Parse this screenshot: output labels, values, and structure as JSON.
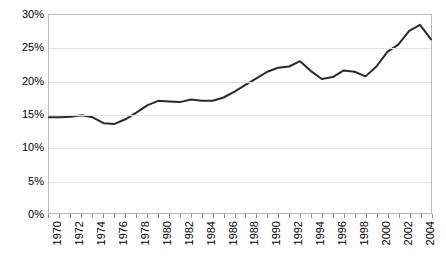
{
  "chart_data": {
    "type": "line",
    "title": "",
    "subtitle": "",
    "xlabel": "",
    "ylabel": "",
    "grid": true,
    "legend": false,
    "legend_position": "none",
    "line_color": "#2b2b2b",
    "gridline_color": "#e2e2e2",
    "frame_color": "#b9b9b9",
    "background_color": "#ffffff",
    "y_tick_labels": [
      "30%",
      "25%",
      "20%",
      "15%",
      "10%",
      "5%",
      "0%"
    ],
    "y_tick_values": [
      30,
      25,
      20,
      15,
      10,
      5,
      0
    ],
    "ylim": [
      0,
      30
    ],
    "xlim": [
      1970,
      2005
    ],
    "x_tick_labels": [
      "1970",
      "1972",
      "1974",
      "1976",
      "1978",
      "1980",
      "1982",
      "1984",
      "1986",
      "1988",
      "1990",
      "1992",
      "1994",
      "1996",
      "1998",
      "2000",
      "2002",
      "2004"
    ],
    "x_tick_values": [
      1970,
      1972,
      1974,
      1976,
      1978,
      1980,
      1982,
      1984,
      1986,
      1988,
      1990,
      1992,
      1994,
      1996,
      1998,
      2000,
      2002,
      2004
    ],
    "x": [
      1970,
      1971,
      1972,
      1973,
      1974,
      1975,
      1976,
      1977,
      1978,
      1979,
      1980,
      1981,
      1982,
      1983,
      1984,
      1985,
      1986,
      1987,
      1988,
      1989,
      1990,
      1991,
      1992,
      1993,
      1994,
      1995,
      1996,
      1997,
      1998,
      1999,
      2000,
      2001,
      2002,
      2003,
      2004,
      2005
    ],
    "values": [
      14.5,
      14.5,
      14.6,
      14.8,
      14.5,
      13.6,
      13.5,
      14.2,
      15.2,
      16.3,
      17.0,
      16.9,
      16.8,
      17.2,
      17.0,
      17.0,
      17.5,
      18.4,
      19.4,
      20.4,
      21.4,
      22.0,
      22.2,
      23.0,
      21.5,
      20.3,
      20.6,
      21.6,
      21.4,
      20.7,
      22.2,
      24.4,
      25.5,
      27.6,
      28.5,
      26.3
    ]
  }
}
